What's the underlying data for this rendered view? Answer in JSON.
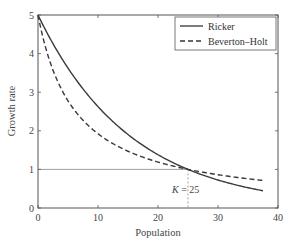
{
  "chart_data": {
    "type": "line",
    "title": "",
    "xlabel": "Population",
    "ylabel": "Growth rate",
    "xlim": [
      0,
      40
    ],
    "ylim": [
      0,
      5
    ],
    "xticks": [
      0,
      10,
      20,
      30,
      40
    ],
    "yticks": [
      0,
      1,
      2,
      3,
      4,
      5
    ],
    "grid": false,
    "legend_position": "upper right",
    "series": [
      {
        "name": "Ricker",
        "style": "solid",
        "formula": "5*exp(-ln(5)*N/25)",
        "x": [
          0,
          2.5,
          5,
          7.5,
          10,
          12.5,
          15,
          17.5,
          20,
          22.5,
          25,
          27.5,
          30,
          32.5,
          35,
          37.5
        ],
        "values": [
          5.0,
          4.26,
          3.62,
          3.08,
          2.63,
          2.24,
          1.9,
          1.62,
          1.38,
          1.17,
          1.0,
          0.85,
          0.72,
          0.62,
          0.53,
          0.45
        ]
      },
      {
        "name": "Beverton–Holt",
        "style": "dashed",
        "formula": "5/(1+4*N/25)",
        "x": [
          0,
          2.5,
          5,
          7.5,
          10,
          12.5,
          15,
          17.5,
          20,
          22.5,
          25,
          27.5,
          30,
          32.5,
          35,
          37.5
        ],
        "values": [
          5.0,
          3.57,
          2.78,
          2.27,
          1.92,
          1.67,
          1.47,
          1.32,
          1.19,
          1.09,
          1.0,
          0.93,
          0.86,
          0.81,
          0.76,
          0.71
        ]
      }
    ],
    "annotations": [
      {
        "text": "K = 25",
        "x": 25,
        "y": 0.6,
        "note": "vertical dotted line at x=25 from y=0 to 1"
      },
      {
        "text": "",
        "type": "hline",
        "y": 1,
        "note": "thin horizontal line at growth rate 1 from x=0 to 25"
      }
    ]
  },
  "labels": {
    "xlabel": "Population",
    "ylabel": "Growth rate",
    "legend_ricker": "Ricker",
    "legend_bh": "Beverton–Holt",
    "k_italic": "K",
    "k_value": " = 25",
    "xticks": [
      "0",
      "10",
      "20",
      "30",
      "40"
    ],
    "yticks": [
      "0",
      "1",
      "2",
      "3",
      "4",
      "5"
    ]
  }
}
